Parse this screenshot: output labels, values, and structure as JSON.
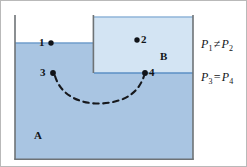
{
  "figure": {
    "colors": {
      "fluid_a": "#a9c5e2",
      "fluid_b": "#d3e4f3",
      "surface_line": "#5b8fc4",
      "wall": "#6e7376",
      "border": "#b9b9b9",
      "ink": "#111418",
      "background": "#ffffff"
    },
    "chambers": [
      {
        "id": "A",
        "label": "A",
        "label_x": 33,
        "label_y": 128,
        "fluid": "fluid_a"
      },
      {
        "id": "B",
        "label": "B",
        "label_x": 159,
        "label_y": 49,
        "fluid": "fluid_b"
      }
    ],
    "points": [
      {
        "id": "1",
        "label": "1",
        "dot_x": 50,
        "dot_y": 42,
        "label_x": 38,
        "label_y": 35
      },
      {
        "id": "2",
        "label": "2",
        "dot_x": 136,
        "dot_y": 39,
        "label_x": 140,
        "label_y": 32
      },
      {
        "id": "3",
        "label": "3",
        "dot_x": 52,
        "dot_y": 72,
        "label_x": 39,
        "label_y": 65
      },
      {
        "id": "4",
        "label": "4",
        "dot_x": 144,
        "dot_y": 72,
        "label_x": 148,
        "label_y": 65
      }
    ],
    "path": {
      "name": "dashed-process-path",
      "from_point": "3",
      "to_point": "4",
      "style": "dashed-arc"
    },
    "equations": [
      {
        "id": "eq1",
        "lhs": "P",
        "lhs_sub": "1",
        "operator": "≠",
        "rhs": "P",
        "rhs_sub": "2",
        "x": 200,
        "y": 42
      },
      {
        "id": "eq2",
        "lhs": "P",
        "lhs_sub": "3",
        "operator": "=",
        "rhs": "P",
        "rhs_sub": "4",
        "x": 200,
        "y": 75
      }
    ]
  }
}
